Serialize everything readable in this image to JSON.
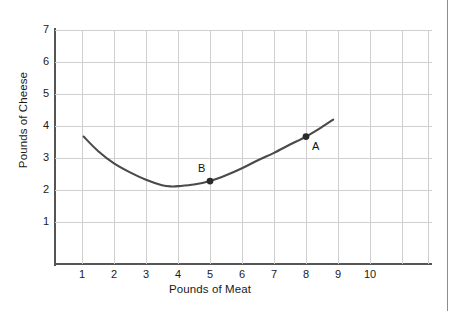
{
  "chart_data": {
    "type": "line",
    "title": "",
    "xlabel": "Pounds of Meat",
    "ylabel": "Pounds of Cheese",
    "xlim": [
      0,
      11.8
    ],
    "ylim": [
      0,
      7.3
    ],
    "xticks": [
      "1",
      "2",
      "3",
      "4",
      "5",
      "6",
      "7",
      "8",
      "9",
      "10"
    ],
    "yticks": [
      "1",
      "2",
      "3",
      "4",
      "5",
      "6",
      "7"
    ],
    "grid": true,
    "legend": null,
    "series": [
      {
        "name": "isoquant",
        "x": [
          1.05,
          1.5,
          2.0,
          2.5,
          3.0,
          3.5,
          3.8,
          4.0,
          4.5,
          5.0,
          5.5,
          6.0,
          6.5,
          7.0,
          7.5,
          8.0,
          8.5,
          8.85
        ],
        "y": [
          3.67,
          3.22,
          2.83,
          2.55,
          2.32,
          2.15,
          2.11,
          2.12,
          2.17,
          2.28,
          2.46,
          2.68,
          2.93,
          3.16,
          3.42,
          3.67,
          3.97,
          4.2
        ]
      }
    ],
    "annotations": [
      {
        "label": "A",
        "x": 8.0,
        "y": 3.67,
        "marker": true,
        "label_dx": 0.28,
        "label_dy": -0.3
      },
      {
        "label": "B",
        "x": 5.0,
        "y": 2.28,
        "marker": true,
        "label_dx": -0.28,
        "label_dy": 0.42
      }
    ],
    "colors": {
      "curve": "#4a4a4a",
      "grid": "#cfcfcf",
      "axis": "#555555",
      "text": "#1a1a1a",
      "marker": "#2b2b2b",
      "border": "#8d8d8d",
      "background": "#ffffff"
    }
  }
}
